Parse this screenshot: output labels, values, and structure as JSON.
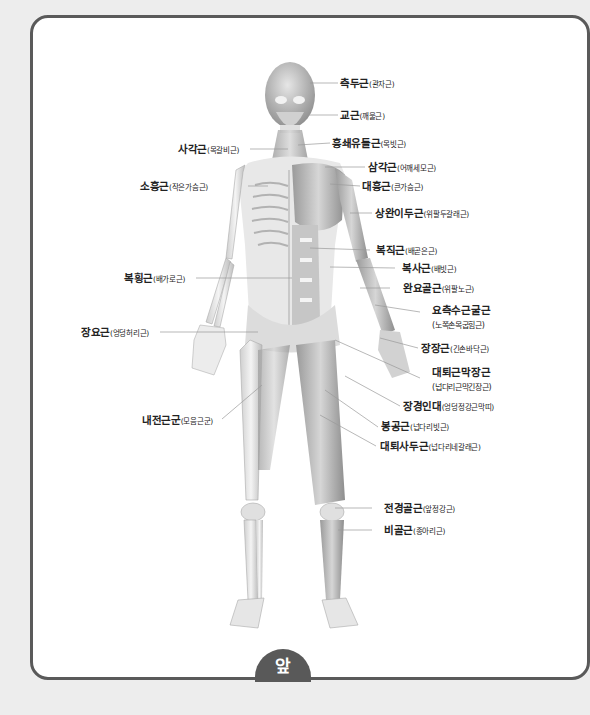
{
  "diagram": {
    "view_label": "앞",
    "labels_right": [
      {
        "id": "temporalis",
        "main": "측두근",
        "sub": "(관자근)"
      },
      {
        "id": "masseter",
        "main": "교근",
        "sub": "(깨물근)"
      },
      {
        "id": "sternocleidomastoid",
        "main": "흉쇄유돌근",
        "sub": "(목빗근)"
      },
      {
        "id": "deltoid",
        "main": "삼각근",
        "sub": "(어깨세모근)"
      },
      {
        "id": "pectoralis-major",
        "main": "대흉근",
        "sub": "(큰가슴근)"
      },
      {
        "id": "biceps-brachii",
        "main": "상완이두근",
        "sub": "(위팔두갈래근)"
      },
      {
        "id": "rectus-abdominis",
        "main": "복직근",
        "sub": "(배곧은근)"
      },
      {
        "id": "external-oblique",
        "main": "복사근",
        "sub": "(배빗근)"
      },
      {
        "id": "brachioradialis",
        "main": "완요골근",
        "sub": "(위팔노근)"
      },
      {
        "id": "flexor-carpi-radialis",
        "main": "요측수근굴근",
        "sub": "(노쪽손목굽힘근)"
      },
      {
        "id": "palmaris-longus",
        "main": "장장근",
        "sub": "(긴손바닥근)"
      },
      {
        "id": "tensor-fasciae-latae",
        "main": "대퇴근막장근",
        "sub": "(넙다리근막긴장근)"
      },
      {
        "id": "iliotibial-band",
        "main": "장경인대",
        "sub": "(엉덩정강근막띠)"
      },
      {
        "id": "sartorius",
        "main": "봉공근",
        "sub": "(넙다리빗근)"
      },
      {
        "id": "quadriceps",
        "main": "대퇴사두근",
        "sub": "(넙다리네갈래근)"
      },
      {
        "id": "tibialis-anterior",
        "main": "전경골근",
        "sub": "(앞정강근)"
      },
      {
        "id": "peroneus",
        "main": "비골근",
        "sub": "(종아리근)"
      }
    ],
    "labels_left": [
      {
        "id": "scalene",
        "main": "사각근",
        "sub": "(목갈비근)"
      },
      {
        "id": "pectoralis-minor",
        "main": "소흉근",
        "sub": "(작은가슴근)"
      },
      {
        "id": "transversus-abdominis",
        "main": "복횡근",
        "sub": "(배가로근)"
      },
      {
        "id": "psoas-major",
        "main": "장요근",
        "sub": "(엉덩허리근)"
      },
      {
        "id": "adductors",
        "main": "내전근군",
        "sub": "(모음근군)"
      }
    ]
  }
}
